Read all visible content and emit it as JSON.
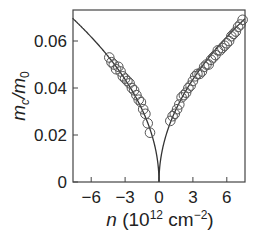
{
  "chart_data": {
    "type": "scatter",
    "title": "",
    "xlabel": "n (10^12 cm^-2)",
    "ylabel": "m_c/m_0",
    "xlim": [
      -7.5,
      7.7
    ],
    "ylim": [
      0,
      0.073
    ],
    "x_ticks": [
      -6,
      -3,
      0,
      3,
      6
    ],
    "x_tick_labels": [
      "−6",
      "−3",
      "0",
      "3",
      "6"
    ],
    "y_ticks": [
      0,
      0.02,
      0.04,
      0.06
    ],
    "y_tick_labels": [
      "0",
      "0.02",
      "0.04",
      "0.06"
    ],
    "grid": false,
    "legend": null,
    "series": [
      {
        "name": "measured",
        "style": "open-circles",
        "x": [
          -4.4,
          -4.2,
          -4.0,
          -3.8,
          -3.6,
          -3.4,
          -3.2,
          -3.0,
          -2.8,
          -2.6,
          -2.4,
          -2.2,
          -2.0,
          -1.8,
          -1.6,
          -1.4,
          -1.2,
          -1.0,
          -0.8,
          1.0,
          1.2,
          1.4,
          1.6,
          1.8,
          2.0,
          2.2,
          2.4,
          2.6,
          2.8,
          3.0,
          3.2,
          3.4,
          3.6,
          3.8,
          4.0,
          4.2,
          4.4,
          4.6,
          4.8,
          5.0,
          5.2,
          5.4,
          5.6,
          5.8,
          6.0,
          6.2,
          6.4,
          6.6,
          6.8,
          7.0,
          7.2,
          7.4
        ],
        "y": [
          0.053,
          0.051,
          0.05,
          0.048,
          0.049,
          0.047,
          0.045,
          0.044,
          0.043,
          0.042,
          0.04,
          0.039,
          0.037,
          0.035,
          0.034,
          0.031,
          0.029,
          0.025,
          0.021,
          0.026,
          0.028,
          0.029,
          0.031,
          0.033,
          0.036,
          0.037,
          0.038,
          0.04,
          0.041,
          0.043,
          0.045,
          0.046,
          0.046,
          0.047,
          0.049,
          0.05,
          0.05,
          0.052,
          0.053,
          0.054,
          0.056,
          0.056,
          0.057,
          0.058,
          0.059,
          0.06,
          0.062,
          0.063,
          0.064,
          0.066,
          0.067,
          0.069
        ]
      },
      {
        "name": "fit",
        "style": "line",
        "formula": "0.0252*sqrt(|n|)"
      }
    ]
  },
  "labels": {
    "ylabel_main": "m",
    "ylabel_sub": "c",
    "ylabel_den": "/m",
    "ylabel_den_sub": "0",
    "xlabel_var": "n",
    "xlabel_unit_a": " (10",
    "xlabel_unit_exp": "12",
    "xlabel_unit_b": " cm",
    "xlabel_unit_exp2": "−2",
    "xlabel_unit_c": ")"
  }
}
